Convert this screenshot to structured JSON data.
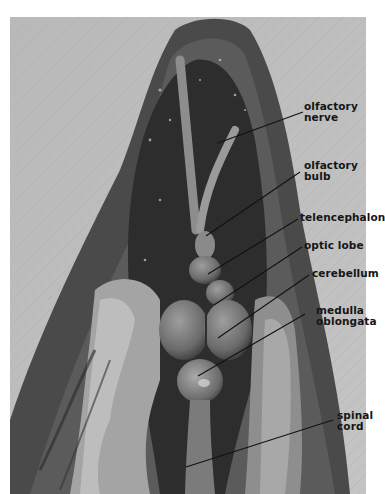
{
  "figure": {
    "labels": [
      {
        "id": "olfactory-nerve",
        "lines": [
          "olfactory",
          "nerve"
        ]
      },
      {
        "id": "olfactory-bulb",
        "lines": [
          "olfactory",
          "bulb"
        ]
      },
      {
        "id": "telencephalon",
        "lines": [
          "telencephalon"
        ]
      },
      {
        "id": "optic-lobe",
        "lines": [
          "optic lobe"
        ]
      },
      {
        "id": "cerebellum",
        "lines": [
          "cerebellum"
        ]
      },
      {
        "id": "medulla-oblongata",
        "lines": [
          "medulla",
          "oblongata"
        ]
      },
      {
        "id": "spinal-cord",
        "lines": [
          "spinal",
          "cord"
        ]
      }
    ]
  }
}
